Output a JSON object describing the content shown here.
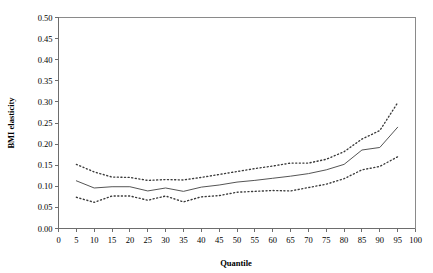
{
  "chart_data": {
    "type": "line",
    "title": "",
    "xlabel": "Quantile",
    "ylabel": "BMI elasticity",
    "xlim": [
      0,
      100
    ],
    "ylim": [
      0.0,
      0.5
    ],
    "xticks": [
      0,
      5,
      10,
      15,
      20,
      25,
      30,
      35,
      40,
      45,
      50,
      55,
      60,
      65,
      70,
      75,
      80,
      85,
      90,
      95,
      100
    ],
    "xtick_labels": [
      "0",
      "5",
      "10",
      "15",
      "20",
      "25",
      "30",
      "35",
      "40",
      "45",
      "50",
      "55",
      "60",
      "65",
      "70",
      "75",
      "80",
      "85",
      "90",
      "95",
      "100"
    ],
    "yticks": [
      0.0,
      0.05,
      0.1,
      0.15,
      0.2,
      0.25,
      0.3,
      0.35,
      0.4,
      0.45,
      0.5
    ],
    "ytick_labels": [
      "0.00",
      "0.05",
      "0.10",
      "0.15",
      "0.20",
      "0.25",
      "0.30",
      "0.35",
      "0.40",
      "0.45",
      "0.50"
    ],
    "grid": false,
    "legend": null,
    "x": [
      5,
      10,
      15,
      20,
      25,
      30,
      35,
      40,
      45,
      50,
      55,
      60,
      65,
      70,
      75,
      80,
      85,
      90,
      95
    ],
    "series": [
      {
        "name": "BMI elasticity estimate",
        "style": "solid",
        "values": [
          0.113,
          0.096,
          0.099,
          0.099,
          0.089,
          0.096,
          0.088,
          0.098,
          0.103,
          0.11,
          0.114,
          0.119,
          0.124,
          0.13,
          0.139,
          0.152,
          0.186,
          0.192,
          0.24
        ]
      },
      {
        "name": "Upper confidence bound",
        "style": "dotted",
        "values": [
          0.152,
          0.134,
          0.122,
          0.121,
          0.114,
          0.116,
          0.115,
          0.121,
          0.128,
          0.135,
          0.142,
          0.148,
          0.155,
          0.155,
          0.164,
          0.182,
          0.212,
          0.232,
          0.298
        ]
      },
      {
        "name": "Lower confidence bound",
        "style": "dotted",
        "values": [
          0.074,
          0.062,
          0.077,
          0.077,
          0.067,
          0.077,
          0.063,
          0.075,
          0.078,
          0.086,
          0.088,
          0.09,
          0.089,
          0.097,
          0.105,
          0.118,
          0.139,
          0.147,
          0.17
        ]
      }
    ]
  }
}
